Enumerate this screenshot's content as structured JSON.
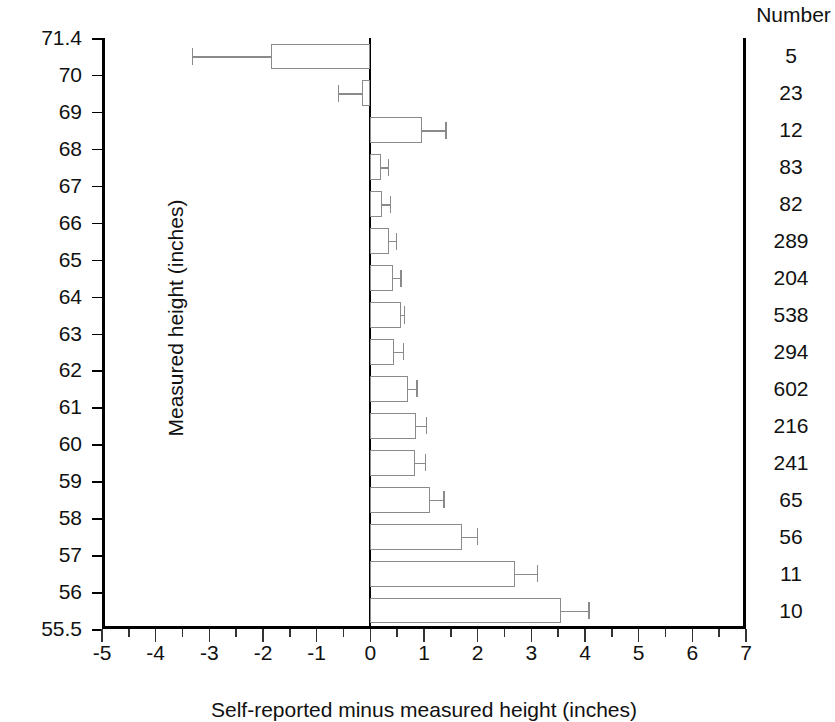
{
  "figure": {
    "xlabel": "Self-reported minus measured height (inches)",
    "ylabel": "Measured height (inches)",
    "number_header": "Number"
  },
  "chart_data": {
    "type": "bar",
    "orientation": "horizontal",
    "title": "",
    "xlabel": "Self-reported minus measured height (inches)",
    "ylabel": "Measured height (inches)",
    "xlim": [
      -5,
      7
    ],
    "ylim": [
      55.5,
      71.4
    ],
    "grid": false,
    "legend": null,
    "xticks": [
      "-5",
      "-4",
      "-3",
      "-2",
      "-1",
      "0",
      "1",
      "2",
      "3",
      "4",
      "5",
      "6",
      "7"
    ],
    "xtick_values": [
      -5,
      -4,
      -3,
      -2,
      -1,
      0,
      1,
      2,
      3,
      4,
      5,
      6,
      7
    ],
    "yticks": [
      "71.4",
      "70",
      "69",
      "68",
      "67",
      "66",
      "65",
      "64",
      "63",
      "62",
      "61",
      "60",
      "59",
      "58",
      "57",
      "56",
      "55.5"
    ],
    "ytick_values": [
      71.4,
      70,
      69,
      68,
      67,
      66,
      65,
      64,
      63,
      62,
      61,
      60,
      59,
      58,
      57,
      56,
      55.5
    ],
    "number_column_header": "Number",
    "categories": [
      "71.4-70",
      "70-69",
      "69-68",
      "68-67",
      "67-66",
      "66-65",
      "65-64",
      "64-63",
      "63-62",
      "62-61",
      "61-60",
      "60-59",
      "59-58",
      "58-57",
      "57-56",
      "56-55.5"
    ],
    "bands": [
      {
        "top": 71.4,
        "bottom": 70,
        "value": -1.85,
        "err_low": -3.32,
        "err_high": -1.85,
        "number": "5"
      },
      {
        "top": 70,
        "bottom": 69,
        "value": -0.16,
        "err_low": -0.6,
        "err_high": -0.16,
        "number": "23"
      },
      {
        "top": 69,
        "bottom": 68,
        "value": 0.97,
        "err_low": 0.97,
        "err_high": 1.4,
        "number": "12"
      },
      {
        "top": 68,
        "bottom": 67,
        "value": 0.19,
        "err_low": 0.19,
        "err_high": 0.33,
        "number": "83"
      },
      {
        "top": 67,
        "bottom": 66,
        "value": 0.21,
        "err_low": 0.21,
        "err_high": 0.37,
        "number": "82"
      },
      {
        "top": 66,
        "bottom": 65,
        "value": 0.34,
        "err_low": 0.34,
        "err_high": 0.48,
        "number": "289"
      },
      {
        "top": 65,
        "bottom": 64,
        "value": 0.43,
        "err_low": 0.43,
        "err_high": 0.56,
        "number": "204"
      },
      {
        "top": 64,
        "bottom": 63,
        "value": 0.57,
        "err_low": 0.57,
        "err_high": 0.63,
        "number": "538"
      },
      {
        "top": 63,
        "bottom": 62,
        "value": 0.45,
        "err_low": 0.45,
        "err_high": 0.6,
        "number": "294"
      },
      {
        "top": 62,
        "bottom": 61,
        "value": 0.71,
        "err_low": 0.71,
        "err_high": 0.86,
        "number": "602"
      },
      {
        "top": 61,
        "bottom": 60,
        "value": 0.86,
        "err_low": 0.86,
        "err_high": 1.04,
        "number": "216"
      },
      {
        "top": 60,
        "bottom": 59,
        "value": 0.83,
        "err_low": 0.83,
        "err_high": 1.02,
        "number": "241"
      },
      {
        "top": 59,
        "bottom": 58,
        "value": 1.12,
        "err_low": 1.12,
        "err_high": 1.36,
        "number": "65"
      },
      {
        "top": 58,
        "bottom": 57,
        "value": 1.7,
        "err_low": 1.7,
        "err_high": 1.98,
        "number": "56"
      },
      {
        "top": 57,
        "bottom": 56,
        "value": 2.7,
        "err_low": 2.7,
        "err_high": 3.1,
        "number": "11"
      },
      {
        "top": 56,
        "bottom": 55.5,
        "value": 3.56,
        "err_low": 3.56,
        "err_high": 4.06,
        "number": "10"
      }
    ]
  },
  "colors": {
    "axis": "#000000",
    "bar_outline": "#8a8a8a",
    "text": "#111111",
    "background": "#ffffff"
  }
}
